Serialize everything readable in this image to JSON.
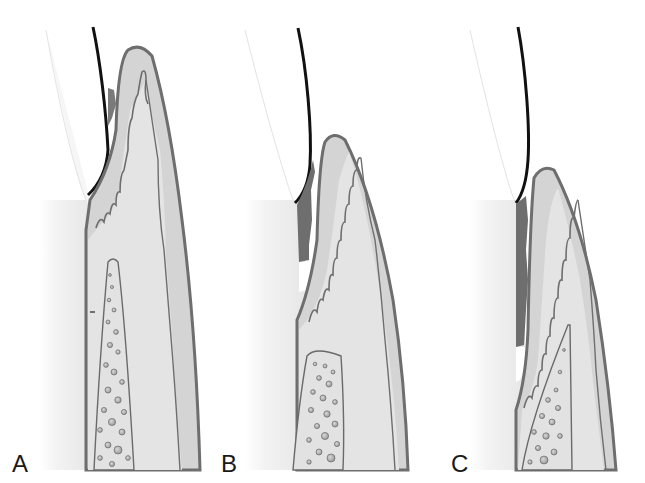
{
  "figure": {
    "type": "three-panel anatomical illustration",
    "colors": {
      "background": "#ffffff",
      "tooth_shade": "#e6e6e6",
      "enamel_edge": "#111111",
      "gingiva_outer": "#c9c9c9",
      "gingiva_inner": "#dedede",
      "epithelium_outline": "#707070",
      "bone_fill": "#e2e2e2",
      "bone_outline": "#6a6a6a",
      "calculus": "#6e6e6e"
    },
    "panels": [
      {
        "id": "A",
        "label": "A"
      },
      {
        "id": "B",
        "label": "B"
      },
      {
        "id": "C",
        "label": "C"
      }
    ]
  }
}
